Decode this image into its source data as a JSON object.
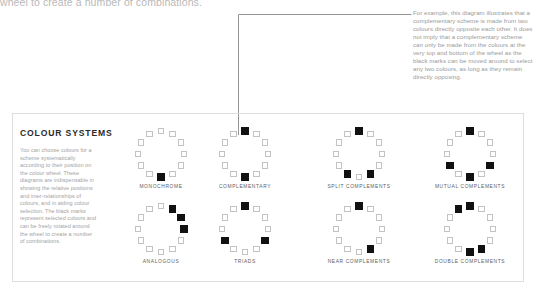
{
  "page": {
    "cut_off_line": "wheel to create a number of combinations.",
    "callout_text": "For example, this diagram illustrates that a complementary scheme is made from two colours directly opposite each other. It does not imply that a complementary scheme can only be made from the colours at the very top and bottom of the wheel as the black marks can be moved around to select any two colours, as long as they remain directly opposing.",
    "colors": {
      "ink": "#231f20",
      "marker_on": "#111111",
      "marker_off_border": "#c3c3c3",
      "panel_border": "#dddddd",
      "body_text": "#a3a3a3",
      "label_text": "#5e5e5e",
      "leader_line": "#8a8a8a"
    }
  },
  "panel": {
    "heading": "COLOUR SYSTEMS",
    "body": "You can choose colours for a scheme systematically according to their position on the colour wheel. These diagrams are indispensable in showing the relative positions and inter-relationships of colours, and in aiding colour selection. The black marks represent selected colours and can be freely rotated around the wheel to create a number of combinations."
  },
  "diagrams": [
    {
      "label": "MONOCHROME",
      "segments": 12,
      "selected": [
        6
      ]
    },
    {
      "label": "COMPLEMENTARY",
      "segments": 12,
      "selected": [
        0,
        6
      ]
    },
    {
      "label": "SPLIT COMPLEMENTS",
      "segments": 12,
      "selected": [
        0,
        5,
        7
      ]
    },
    {
      "label": "MUTUAL COMPLEMENTS",
      "segments": 12,
      "selected": [
        0,
        4,
        6,
        8
      ]
    },
    {
      "label": "ANALOGOUS",
      "segments": 12,
      "selected": [
        1,
        2,
        3
      ]
    },
    {
      "label": "TRIADS",
      "segments": 12,
      "selected": [
        0,
        4,
        8
      ]
    },
    {
      "label": "NEAR COMPLEMENTS",
      "segments": 12,
      "selected": [
        0,
        5
      ]
    },
    {
      "label": "DOUBLE COMPLEMENTS",
      "segments": 12,
      "selected": [
        11,
        0,
        5,
        6
      ]
    }
  ],
  "layout": {
    "wheel_positions": [
      {
        "left": 118,
        "top": 128
      },
      {
        "left": 202,
        "top": 128
      },
      {
        "left": 316,
        "top": 128
      },
      {
        "left": 427,
        "top": 128
      },
      {
        "left": 118,
        "top": 203
      },
      {
        "left": 202,
        "top": 203
      },
      {
        "left": 316,
        "top": 203
      },
      {
        "left": 427,
        "top": 203
      }
    ]
  }
}
